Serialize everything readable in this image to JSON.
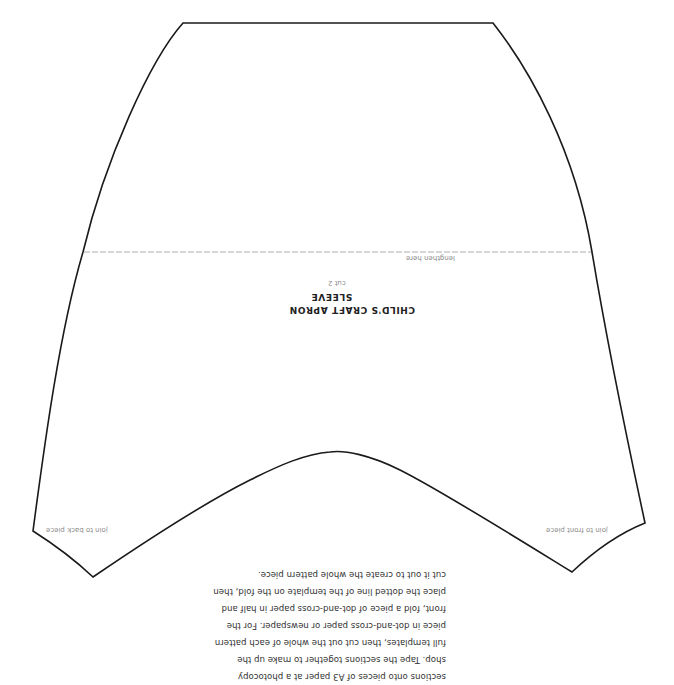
{
  "pattern": {
    "title_line1": "CHILD'S CRAFT APRON",
    "title_line2": "SLEEVE",
    "cut_instruction": "cut 2",
    "lengthen_label": "lengthen here",
    "join_back_label": "join to back piece",
    "join_front_label": "join to front piece",
    "orientation": "rotated 180°",
    "colors": {
      "outline": "#1a1a1a",
      "dashed_line": "#9a9a9a",
      "text": "#333333",
      "muted_text": "#8a8a8a"
    }
  },
  "instructions": {
    "lines": [
      "sections onto pieces of A3 paper at a photocopy",
      "shop. Tape the sections together to make up the",
      "full templates, then cut out the whole of each pattern",
      "piece in dot-and-cross paper or newspaper. For the",
      "front, fold a piece of dot-and-cross paper in half and",
      "place the dotted line of the template on the fold, then",
      "cut it out to create the whole pattern piece."
    ]
  }
}
